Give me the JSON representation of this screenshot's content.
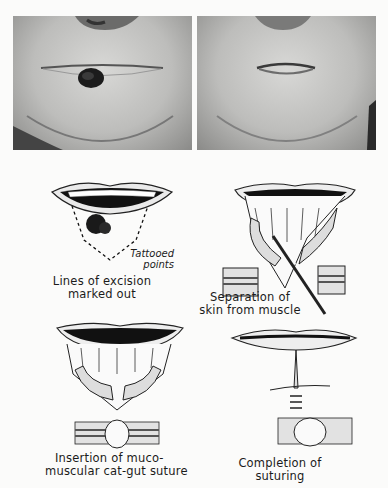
{
  "plate": {
    "photos": [
      {
        "id": "before",
        "label": "Pre-operative photo: lesion on lower lip"
      },
      {
        "id": "after",
        "label": "Post-operative photo: healed lower lip"
      }
    ],
    "figures": [
      {
        "caption_line1": "Lines of excision",
        "caption_line2": "marked out",
        "note_line1": "Tattooed",
        "note_line2": "points"
      },
      {
        "caption_line1": "Separation of",
        "caption_line2": "skin from muscle"
      },
      {
        "caption_line1": "Insertion of muco-",
        "caption_line2": "muscular cat-gut suture"
      },
      {
        "caption_line1": "Completion of",
        "caption_line2": "suturing"
      }
    ]
  }
}
